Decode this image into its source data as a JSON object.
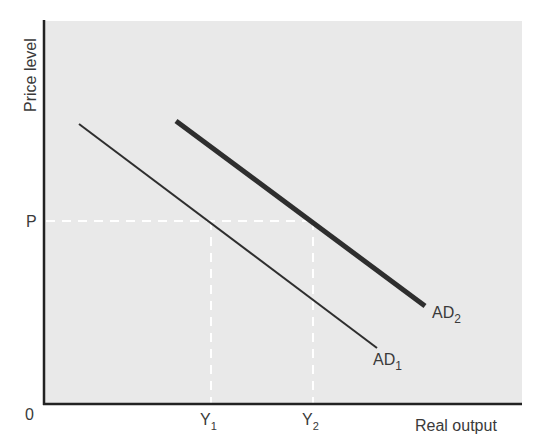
{
  "diagram": {
    "type": "aggregate-demand-shift",
    "y_axis_label": "Price level",
    "x_axis_label": "Real output",
    "origin_label": "0",
    "price_label": "P",
    "output_labels": [
      {
        "base": "Y",
        "sub": "1"
      },
      {
        "base": "Y",
        "sub": "2"
      }
    ],
    "curves": [
      {
        "name": "AD",
        "sub": "1",
        "weight": "thin"
      },
      {
        "name": "AD",
        "sub": "2",
        "weight": "thick"
      }
    ],
    "colors": {
      "plot_background": "#e9e9e9",
      "axis": "#222222",
      "curve": "#2e2e2e",
      "guide": "#ffffff",
      "text": "#3a3a3a"
    }
  }
}
